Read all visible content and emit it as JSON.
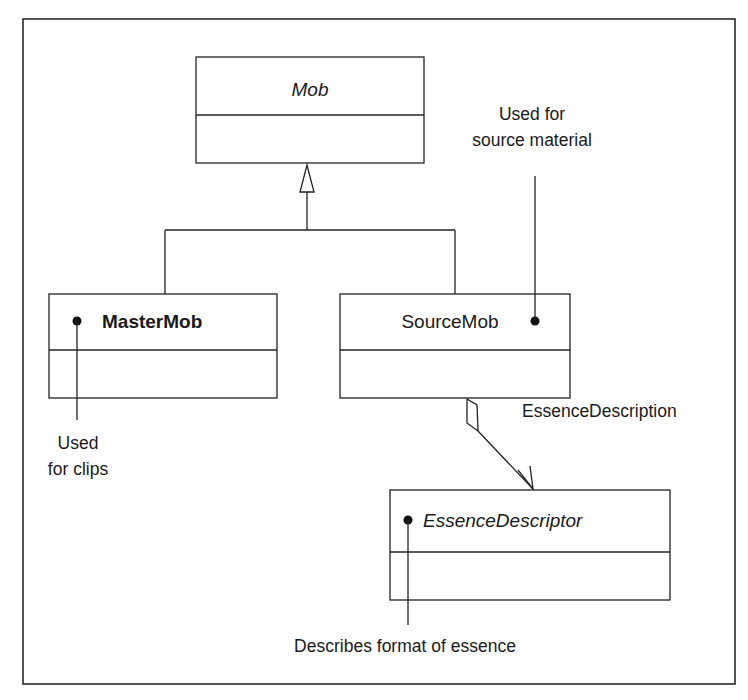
{
  "diagram": {
    "frame": {
      "x": 23,
      "y": 19,
      "w": 712,
      "h": 665
    },
    "classes": {
      "mob": {
        "name": "Mob",
        "style": "italic",
        "x": 196,
        "y": 57,
        "w": 228,
        "h": 106,
        "divider": 115
      },
      "master_mob": {
        "name": "MasterMob",
        "style": "bold",
        "x": 49,
        "y": 294,
        "w": 228,
        "h": 104,
        "divider": 350
      },
      "source_mob": {
        "name": "SourceMob",
        "style": "normal",
        "x": 340,
        "y": 294,
        "w": 230,
        "h": 104,
        "divider": 350
      },
      "essence_descriptor": {
        "name": "EssenceDescriptor",
        "style": "italic",
        "x": 390,
        "y": 490,
        "w": 280,
        "h": 110,
        "divider": 552
      }
    },
    "notes": {
      "source_note": {
        "lines": [
          "Used for",
          "source material"
        ]
      },
      "master_note": {
        "lines": [
          "Used",
          "for clips"
        ]
      },
      "essence_note": {
        "lines": [
          "Describes format of essence"
        ]
      }
    },
    "associations": {
      "essence_description": {
        "label": "EssenceDescription",
        "type": "aggregation"
      }
    },
    "generalization": {
      "parent": "Mob",
      "children": [
        "MasterMob",
        "SourceMob"
      ]
    }
  }
}
